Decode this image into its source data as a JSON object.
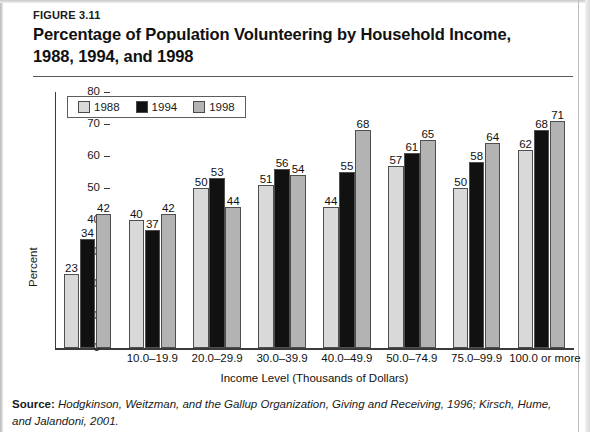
{
  "figure": {
    "number": "FIGURE 3.11"
  },
  "source": {
    "label": "Source:",
    "part1": " Hodgkinson, Weitzman, and the Gallup Organization,",
    "part2": " Giving and Receiving,",
    "part3": " 1996; Kirsch, Hume,",
    "part4": "and Jalandoni, 2001."
  },
  "legend": {
    "position": "top-left-inside",
    "items": [
      {
        "label": "1988",
        "color": "#d9d9d9"
      },
      {
        "label": "1994",
        "color": "#111111"
      },
      {
        "label": "1998",
        "color": "#b3b3b3"
      }
    ]
  },
  "axis": {
    "ylabel": "Percent",
    "xlabel": "Income Level (Thousands of Dollars)",
    "yticks": [
      "0",
      "10",
      "20",
      "30",
      "40",
      "50",
      "60",
      "70",
      "80"
    ]
  },
  "chart_data": {
    "type": "bar",
    "xlabel": "Income Level (Thousands of Dollars)",
    "ylabel": "Percent",
    "ylim": [
      0,
      80
    ],
    "ytick_step": 10,
    "grid": false,
    "legend_position": "upper left",
    "categories": [
      "",
      "10.0–19.9",
      "20.0–29.9",
      "30.0–39.9",
      "40.0–49.9",
      "50.0–74.9",
      "75.0–99.9",
      "100.0 or more"
    ],
    "series": [
      {
        "name": "1988",
        "color": "#d9d9d9",
        "values": [
          23,
          40,
          50,
          51,
          44,
          57,
          50,
          62
        ]
      },
      {
        "name": "1994",
        "color": "#111111",
        "values": [
          34,
          37,
          53,
          56,
          55,
          61,
          58,
          68
        ]
      },
      {
        "name": "1998",
        "color": "#b3b3b3",
        "values": [
          42,
          42,
          44,
          54,
          68,
          65,
          64,
          71
        ]
      }
    ]
  }
}
